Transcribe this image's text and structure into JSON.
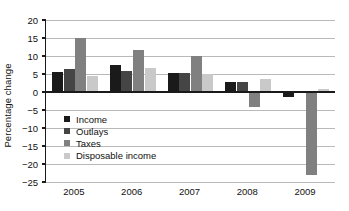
{
  "chart_data": {
    "type": "bar",
    "title": "",
    "xlabel": "",
    "ylabel": "Percentage change",
    "categories": [
      "2005",
      "2006",
      "2007",
      "2008",
      "2009"
    ],
    "series": [
      {
        "name": "Income",
        "color": "#1a1a1a",
        "values": [
          5.5,
          7.5,
          5.4,
          2.9,
          -1.5
        ]
      },
      {
        "name": "Outlays",
        "color": "#454545",
        "values": [
          6.5,
          5.8,
          5.4,
          2.9,
          -0.2
        ]
      },
      {
        "name": "Taxes",
        "color": "#808080",
        "values": [
          15.1,
          11.7,
          9.9,
          -4.1,
          -23.0
        ]
      },
      {
        "name": "Disposable income",
        "color": "#c9c9c9",
        "values": [
          4.5,
          6.8,
          4.9,
          3.7,
          0.8
        ]
      }
    ],
    "ylim": [
      -25,
      20
    ],
    "yticks": [
      20,
      15,
      10,
      5,
      0,
      -5,
      -10,
      -15,
      -20,
      -25
    ],
    "ytick_labels": [
      "20",
      "15",
      "10",
      "5",
      "0",
      "−5",
      "−10",
      "−15",
      "−20",
      "−25"
    ],
    "grid": true,
    "legend_position": "inside-lower-left",
    "axis_color": "#1a1a1a",
    "grid_color": "#b9b9b9",
    "background": "#ffffff"
  }
}
